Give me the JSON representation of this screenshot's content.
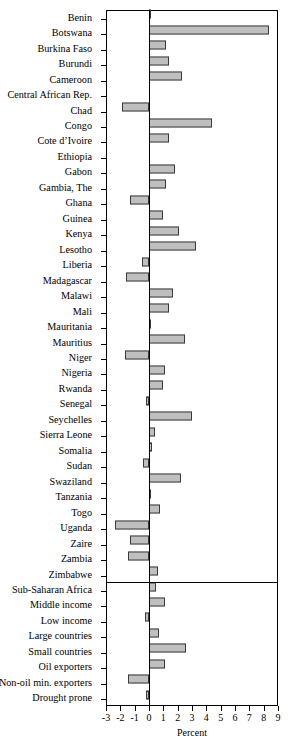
{
  "chart_data": {
    "type": "bar",
    "orientation": "horizontal",
    "title": "",
    "xlabel": "Percent",
    "ylabel": "",
    "xlim": [
      -3,
      9
    ],
    "xticks": [
      -3,
      -2,
      -1,
      0,
      1,
      2,
      3,
      4,
      5,
      6,
      7,
      8,
      9
    ],
    "xticklabels": [
      "-3",
      "-2",
      "-1",
      "0",
      "1",
      "2",
      "3",
      "4",
      "5",
      "6",
      "7",
      "8",
      "9"
    ],
    "grid": false,
    "legend": null,
    "zero_reference_line": true,
    "group_separator_after": "Zimbabwe",
    "categories": [
      "Benin",
      "Botswana",
      "Burkina Faso",
      "Burundi",
      "Cameroon",
      "Central African Rep.",
      "Chad",
      "Congo",
      "Cote d’Ivoire",
      "Ethiopia",
      "Gabon",
      "Gambia, The",
      "Ghana",
      "Guinea",
      "Kenya",
      "Lesotho",
      "Liberia",
      "Madagascar",
      "Malawi",
      "Mali",
      "Mauritania",
      "Mauritius",
      "Niger",
      "Nigeria",
      "Rwanda",
      "Senegal",
      "Seychelles",
      "Sierra Leone",
      "Somalia",
      "Sudan",
      "Swaziland",
      "Tanzania",
      "Togo",
      "Uganda",
      "Zaire",
      "Zambia",
      "Zimbabwe",
      "Sub-Saharan Africa",
      "Middle income",
      "Low income",
      "Large countries",
      "Small countries",
      "Oil exporters",
      "Non-oil min. exporters",
      "Drought prone"
    ],
    "values": [
      0.1,
      8.4,
      1.2,
      1.4,
      2.3,
      0.0,
      -1.9,
      4.4,
      1.4,
      0.0,
      1.8,
      1.2,
      -1.3,
      1.0,
      2.1,
      3.3,
      -0.5,
      -1.6,
      1.7,
      1.4,
      0.1,
      2.5,
      -1.7,
      1.1,
      1.0,
      -0.2,
      3.0,
      0.4,
      0.2,
      -0.4,
      2.2,
      0.1,
      0.8,
      -2.4,
      -1.3,
      -1.5,
      0.6,
      0.5,
      1.1,
      -0.3,
      0.7,
      2.6,
      1.1,
      -1.5,
      -0.2
    ],
    "bar_color": "#bfbfbf",
    "bar_edge_color": "#3a3a3a",
    "axis_color": "#000000"
  }
}
